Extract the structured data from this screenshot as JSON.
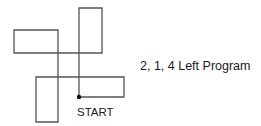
{
  "diagram": {
    "caption": "2, 1, 4 Left Program",
    "start_label": "START",
    "line_color": "#555555",
    "dot_color": "#111111",
    "path_points": [
      [
        79,
        97
      ],
      [
        79,
        8
      ],
      [
        102,
        8
      ],
      [
        102,
        53
      ],
      [
        14,
        53
      ],
      [
        14,
        30
      ],
      [
        58,
        30
      ],
      [
        58,
        122
      ],
      [
        36,
        122
      ],
      [
        36,
        77
      ],
      [
        124,
        77
      ],
      [
        124,
        97
      ],
      [
        79,
        97
      ]
    ],
    "start_point": [
      79,
      97
    ]
  }
}
